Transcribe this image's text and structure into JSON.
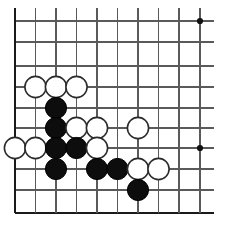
{
  "diagram": {
    "kind": "go-board-diagram",
    "board": {
      "columns": 10,
      "rows": 10,
      "column_x": [
        15,
        35.5,
        56,
        76.5,
        97,
        117.5,
        138,
        158.5,
        179,
        200
      ],
      "row_y": [
        21,
        42,
        66,
        87,
        108,
        128,
        148,
        169,
        190,
        213
      ],
      "line_color": "#5a5a5a",
      "edge_color": "#1a1a1a",
      "background_color": "#ffffff",
      "stone_radius": 10.6,
      "edges": {
        "left_index": 0,
        "right_index": 9,
        "top_index": 0,
        "bottom_index": 9,
        "left_is_board_edge": true,
        "bottom_is_board_edge": true,
        "top_is_board_edge": false,
        "right_is_board_edge": false
      }
    },
    "star_points": [
      {
        "col": 9,
        "row": 0
      },
      {
        "col": 9,
        "row": 6
      }
    ],
    "stones": [
      {
        "color": "white",
        "col": 1,
        "row": 3
      },
      {
        "color": "white",
        "col": 2,
        "row": 3
      },
      {
        "color": "white",
        "col": 3,
        "row": 3
      },
      {
        "color": "black",
        "col": 2,
        "row": 4
      },
      {
        "color": "black",
        "col": 2,
        "row": 5
      },
      {
        "color": "white",
        "col": 3,
        "row": 5
      },
      {
        "color": "white",
        "col": 4,
        "row": 5
      },
      {
        "color": "white",
        "col": 6,
        "row": 5
      },
      {
        "color": "white",
        "col": 0,
        "row": 6
      },
      {
        "color": "white",
        "col": 1,
        "row": 6
      },
      {
        "color": "black",
        "col": 2,
        "row": 6
      },
      {
        "color": "black",
        "col": 3,
        "row": 6
      },
      {
        "color": "white",
        "col": 4,
        "row": 6
      },
      {
        "color": "black",
        "col": 2,
        "row": 7
      },
      {
        "color": "black",
        "col": 4,
        "row": 7
      },
      {
        "color": "black",
        "col": 5,
        "row": 7
      },
      {
        "color": "white",
        "col": 6,
        "row": 7
      },
      {
        "color": "white",
        "col": 7,
        "row": 7
      },
      {
        "color": "black",
        "col": 6,
        "row": 8
      }
    ],
    "counts": {
      "black_stones": 9,
      "white_stones": 10,
      "total_stones": 19
    }
  }
}
